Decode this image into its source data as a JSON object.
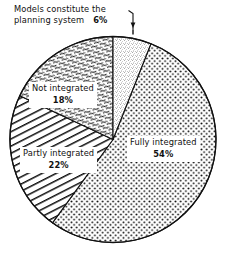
{
  "chart_data": {
    "type": "pie",
    "title": "",
    "subtitle": "",
    "xlabel": "",
    "ylabel": "",
    "legend_position": "none",
    "grid": false,
    "categories": [
      "Fully integrated",
      "Partly integrated",
      "Not integrated",
      "Models constitute the planning system"
    ],
    "values": [
      54,
      22,
      18,
      6
    ],
    "units": "%",
    "total": 100,
    "slices": [
      {
        "label": "Fully integrated",
        "value": 54,
        "value_text": "54%",
        "fill": "coarse-dots",
        "start_angle_deg": 21.6,
        "end_angle_deg": 216.0,
        "label_placement": "inside-right"
      },
      {
        "label": "Partly integrated",
        "value": 22,
        "value_text": "22%",
        "fill": "diagonal-hatch",
        "start_angle_deg": 216.0,
        "end_angle_deg": 295.2,
        "label_placement": "inside-lower-left"
      },
      {
        "label": "Not integrated",
        "value": 18,
        "value_text": "18%",
        "fill": "squiggle",
        "start_angle_deg": 295.2,
        "end_angle_deg": 360.0,
        "label_placement": "inside-upper-left"
      },
      {
        "label": "Models constitute the planning system",
        "value": 6,
        "value_text": "6%",
        "fill": "stipple",
        "start_angle_deg": 0.0,
        "end_angle_deg": 21.6,
        "label_placement": "callout-top"
      }
    ],
    "colors": {
      "background": "#ffffff",
      "ink": "#111111",
      "outline": "#111111"
    }
  },
  "callout": {
    "line1": "Models constitute the",
    "line2": "planning system",
    "percent": "6%",
    "leader": "leader-line-arrow"
  },
  "labels": {
    "not_integrated": {
      "name": "Not integrated",
      "percent": "18%"
    },
    "partly_integrated": {
      "name": "Partly integrated",
      "percent": "22%"
    },
    "fully_integrated": {
      "name": "Fully integrated",
      "percent": "54%"
    }
  }
}
